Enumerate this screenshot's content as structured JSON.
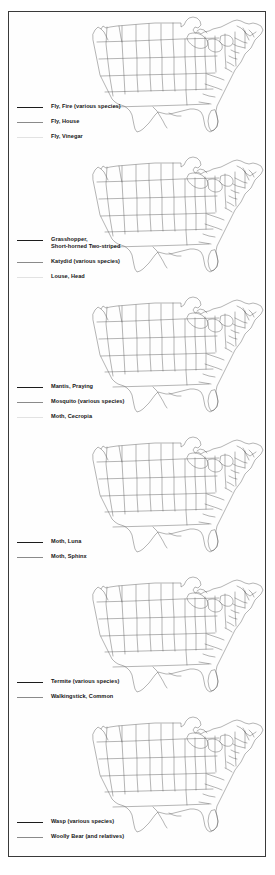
{
  "page": {
    "border_color": "#3a3a3a",
    "background": "#ffffff",
    "map_type": "united-states-outline-with-states"
  },
  "line_styles": {
    "solid": "#1c1c1c",
    "thin": "#8a8a8a",
    "faint": "#e2e2e2"
  },
  "panels": [
    {
      "id": "panel-flies",
      "map_name": "us-range-map-flies",
      "legend": [
        {
          "style": "solid",
          "label": "Fly, Fire (various species)"
        },
        {
          "style": "thin",
          "label": "Fly, House"
        },
        {
          "style": "faint",
          "label": "Fly, Vinegar"
        }
      ]
    },
    {
      "id": "panel-grasshopper-katydid-louse",
      "map_name": "us-range-map-grasshopper-katydid-louse",
      "legend": [
        {
          "style": "solid",
          "label": "Grasshopper,\n   Short-horned Two-striped"
        },
        {
          "style": "thin",
          "label": "Katydid  (various species)"
        },
        {
          "style": "faint",
          "label": "Louse, Head"
        }
      ]
    },
    {
      "id": "panel-mantis-mosquito-moth",
      "map_name": "us-range-map-mantis-mosquito-moth",
      "legend": [
        {
          "style": "solid",
          "label": "Mantis, Praying"
        },
        {
          "style": "thin",
          "label": "Mosquito (various species)"
        },
        {
          "style": "faint",
          "label": "Moth, Cecropia"
        }
      ]
    },
    {
      "id": "panel-moths",
      "map_name": "us-range-map-moths",
      "legend": [
        {
          "style": "solid",
          "label": "Moth, Luna"
        },
        {
          "style": "thin",
          "label": "Moth, Sphinx"
        }
      ]
    },
    {
      "id": "panel-termite-walkingstick",
      "map_name": "us-range-map-termite-walkingstick",
      "legend": [
        {
          "style": "solid",
          "label": "Termite  (various species)"
        },
        {
          "style": "thin",
          "label": "Walkingstick, Common"
        }
      ]
    },
    {
      "id": "panel-wasp-woollybear",
      "map_name": "us-range-map-wasp-woollybear",
      "legend": [
        {
          "style": "solid",
          "label": "Wasp (various species)"
        },
        {
          "style": "thin",
          "label": "Woolly Bear (and relatives)"
        }
      ]
    }
  ]
}
